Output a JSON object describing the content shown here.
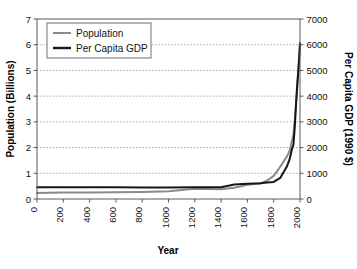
{
  "chart_data": {
    "type": "line",
    "title": "",
    "subtitle": "",
    "xlabel": "Year",
    "ylabel": "Population (Billions)",
    "y2label": "Per Capita GDP (1990 $)",
    "xlim": [
      0,
      2000
    ],
    "ylim": [
      0,
      7
    ],
    "y2lim": [
      0,
      7000
    ],
    "xticks": [
      0,
      200,
      400,
      600,
      800,
      1000,
      1200,
      1400,
      1600,
      1800,
      2000
    ],
    "xtick_labels": [
      "0",
      "200",
      "400",
      "600",
      "800",
      "1000",
      "1200",
      "1400",
      "1600",
      "1800",
      "2000"
    ],
    "yticks": [
      0,
      1,
      2,
      3,
      4,
      5,
      6,
      7
    ],
    "ytick_labels": [
      "0",
      "1",
      "2",
      "3",
      "4",
      "5",
      "6",
      "7"
    ],
    "y2ticks": [
      0,
      1000,
      2000,
      3000,
      4000,
      5000,
      6000,
      7000
    ],
    "y2tick_labels": [
      "0",
      "1000",
      "2000",
      "3000",
      "4000",
      "5000",
      "6000",
      "7000"
    ],
    "grid": "horizontal-dotted",
    "legend_position": "top-left",
    "xtick_label_rotation": -90,
    "series": [
      {
        "name": "Population",
        "axis": "left",
        "color": "#8a8a8a",
        "width": 2,
        "units": "Billions",
        "x": [
          0,
          200,
          400,
          600,
          800,
          1000,
          1200,
          1400,
          1500,
          1600,
          1700,
          1750,
          1800,
          1850,
          1900,
          1920,
          1940,
          1950,
          1960,
          1970,
          1980,
          1990,
          2000
        ],
        "values": [
          0.23,
          0.25,
          0.25,
          0.26,
          0.27,
          0.3,
          0.4,
          0.38,
          0.44,
          0.55,
          0.6,
          0.72,
          0.9,
          1.26,
          1.65,
          1.86,
          2.3,
          2.52,
          3.02,
          3.7,
          4.43,
          5.27,
          6.07
        ]
      },
      {
        "name": "Per Capita GDP",
        "axis": "right",
        "color": "#161616",
        "width": 2,
        "units": "1990 $",
        "x": [
          0,
          200,
          400,
          600,
          800,
          1000,
          1200,
          1400,
          1500,
          1600,
          1700,
          1750,
          1800,
          1850,
          1900,
          1920,
          1940,
          1950,
          1960,
          1970,
          1980,
          1990,
          2000
        ],
        "values": [
          460,
          460,
          460,
          455,
          450,
          450,
          455,
          460,
          565,
          595,
          615,
          645,
          665,
          820,
          1260,
          1530,
          1960,
          2110,
          2770,
          3730,
          4510,
          5150,
          6040
        ]
      }
    ],
    "annotations": []
  },
  "legend": {
    "entries": [
      {
        "label": "Population",
        "color": "#8a8a8a"
      },
      {
        "label": "Per Capita GDP",
        "color": "#161616"
      }
    ]
  },
  "axes": {
    "x_title": "Year",
    "y_left_title": "Population (Billions)",
    "y_right_title": "Per Capita GDP (1990 $)"
  }
}
